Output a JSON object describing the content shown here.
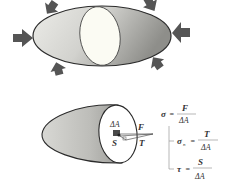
{
  "figure": {
    "top_body": {
      "description": "Body under external compressive loads, sectioned by a plane",
      "arrow_count": 6
    },
    "bottom_body": {
      "labels": {
        "area": "ΔA",
        "force": "F",
        "shear": "S",
        "normal": "T"
      }
    },
    "formulas": {
      "sigma": {
        "lhs": "σ",
        "eq": "=",
        "num": "F",
        "den": "ΔA"
      },
      "sigma_n": {
        "lhs": "σ",
        "sub": "n",
        "eq": "=",
        "num": "T",
        "den": "ΔA"
      },
      "tau": {
        "lhs": "τ",
        "eq": "=",
        "num": "S",
        "den": "ΔA"
      }
    },
    "colors": {
      "arrow": "#555555",
      "outline": "#2b2b2b",
      "cut_face": "#fbfbf3",
      "body_light": "#e8e8e4",
      "body_dark": "#9a9a96",
      "element": "#4a4a4a"
    }
  }
}
